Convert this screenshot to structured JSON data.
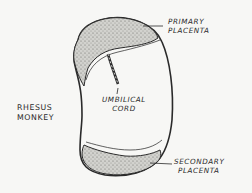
{
  "figure": {
    "species_label": [
      "RHESUS",
      "MONKEY"
    ],
    "labels": {
      "primary": [
        "PRIMARY",
        "PLACENTA"
      ],
      "cord": [
        "UMBILICAL",
        "CORD"
      ],
      "secondary": [
        "SECONDARY",
        "PLACENTA"
      ]
    },
    "colors": {
      "background": "#f7f7f5",
      "ink": "#2a2a2a",
      "stipple_fill": "#c9c9c5"
    }
  }
}
